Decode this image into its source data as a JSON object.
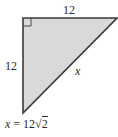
{
  "diagram": {
    "type": "right-triangle",
    "fill_color": "#d9d9d9",
    "stroke_color": "#3a3a3a",
    "labels": {
      "top_side": "12",
      "left_side": "12",
      "hypotenuse": "x"
    },
    "caption": {
      "variable": "x",
      "equals": " = 12",
      "radical": "√",
      "radicand": "2"
    }
  }
}
